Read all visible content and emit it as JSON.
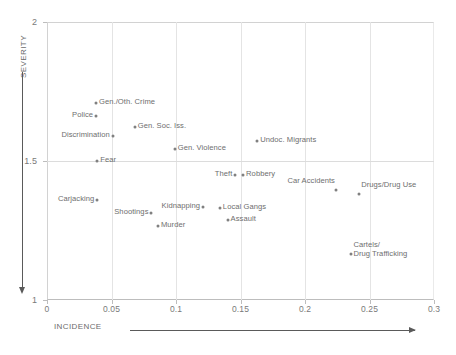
{
  "chart_data": {
    "type": "scatter",
    "title": "",
    "xlabel": "INCIDENCE",
    "ylabel": "SEVERITY",
    "xlim": [
      0,
      0.3
    ],
    "ylim": [
      1,
      2
    ],
    "xticks": [
      "0",
      "0.05",
      "0.1",
      "0.15",
      "0.2",
      "0.25",
      "0.3"
    ],
    "xtick_values": [
      0,
      0.05,
      0.1,
      0.15,
      0.2,
      0.25,
      0.3
    ],
    "yticks": [
      "1",
      "1.5",
      "2"
    ],
    "ytick_values": [
      1,
      1.5,
      2
    ],
    "grid": true,
    "legend": "none",
    "x_axis_arrow": "right",
    "y_axis_arrow": "down",
    "points": [
      {
        "label": "Gen./Oth. Crime",
        "x": 0.038,
        "y": 1.708,
        "label_side": "right"
      },
      {
        "label": "Police",
        "x": 0.038,
        "y": 1.662,
        "label_side": "left"
      },
      {
        "label": "Gen. Soc. Iss.",
        "x": 0.068,
        "y": 1.622,
        "label_side": "right"
      },
      {
        "label": "Discrimination",
        "x": 0.051,
        "y": 1.59,
        "label_side": "left"
      },
      {
        "label": "Gen. Violence",
        "x": 0.099,
        "y": 1.543,
        "label_side": "right"
      },
      {
        "label": "Fear",
        "x": 0.039,
        "y": 1.5,
        "label_side": "right"
      },
      {
        "label": "Undoc. Migrants",
        "x": 0.163,
        "y": 1.572,
        "label_side": "right"
      },
      {
        "label": "Theft",
        "x": 0.146,
        "y": 1.45,
        "label_side": "left"
      },
      {
        "label": "Robbery",
        "x": 0.152,
        "y": 1.45,
        "label_side": "right"
      },
      {
        "label": "Car Accidents",
        "x": 0.224,
        "y": 1.396,
        "label_side": "left-above"
      },
      {
        "label": "Drugs/Drug Use",
        "x": 0.242,
        "y": 1.381,
        "label_side": "right-above"
      },
      {
        "label": "Carjacking",
        "x": 0.039,
        "y": 1.36,
        "label_side": "left"
      },
      {
        "label": "Shootings",
        "x": 0.081,
        "y": 1.313,
        "label_side": "left"
      },
      {
        "label": "Kidnapping",
        "x": 0.121,
        "y": 1.335,
        "label_side": "left"
      },
      {
        "label": "Local Gangs",
        "x": 0.134,
        "y": 1.331,
        "label_side": "right"
      },
      {
        "label": "Murder",
        "x": 0.086,
        "y": 1.266,
        "label_side": "right"
      },
      {
        "label": "Assault",
        "x": 0.14,
        "y": 1.288,
        "label_side": "right"
      },
      {
        "label": "Cartels/\nDrug Trafficking",
        "x": 0.236,
        "y": 1.166,
        "label_side": "right-above"
      }
    ]
  },
  "colors": {
    "point": "#808080",
    "text": "#6e6e6e",
    "grid": "#e4e4e4",
    "axis": "#5a5a5a",
    "background": "#ffffff"
  }
}
